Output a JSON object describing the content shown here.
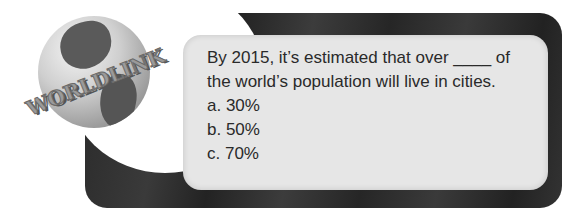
{
  "logo": {
    "text": "WORLDLINK",
    "icon": "globe-icon"
  },
  "question": {
    "text_line1": "By 2015, it’s estimated that over ____ of",
    "text_line2": "the world’s population will live in cities.",
    "options": [
      {
        "label": "a. 30%"
      },
      {
        "label": "b. 50%"
      },
      {
        "label": "c. 70%"
      }
    ]
  },
  "colors": {
    "frame": "#2e2e2e",
    "panel": "#e6e6e6",
    "text": "#2a2a2a"
  }
}
